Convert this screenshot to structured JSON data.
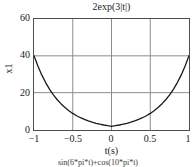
{
  "figure": {
    "title": "2exp(3|t|)",
    "next_figure_caption": "sin(6*pi*t)+cos(10*pi*t)"
  },
  "axes": {
    "y_label": "x1",
    "x_label": "t(s)",
    "y_ticks": [
      "0",
      "20",
      "40",
      "60"
    ],
    "x_ticks": [
      "−1",
      "−0.5",
      "0",
      "0.5",
      "1"
    ]
  },
  "style": {
    "curve_color": "#1a1a1a",
    "grid_color": "#8c8c8c",
    "frame_color": "#4d4d4d",
    "background": "#ffffff"
  },
  "chart_data": {
    "type": "line",
    "title": "2exp(3|t|)",
    "xlabel": "t(s)",
    "ylabel": "x1",
    "xlim": [
      -1,
      1
    ],
    "ylim": [
      0,
      60
    ],
    "xticks": [
      -1,
      -0.5,
      0,
      0.5,
      1
    ],
    "yticks": [
      0,
      20,
      40,
      60
    ],
    "grid": true,
    "legend": null,
    "series": [
      {
        "name": "2exp(3|t|)",
        "formula": "2*exp(3*abs(t))",
        "color": "#1a1a1a",
        "linewidth": 1.2,
        "x": [
          -1,
          -0.95,
          -0.9,
          -0.85,
          -0.8,
          -0.75,
          -0.7,
          -0.65,
          -0.6,
          -0.55,
          -0.5,
          -0.45,
          -0.4,
          -0.35,
          -0.3,
          -0.25,
          -0.2,
          -0.15,
          -0.1,
          -0.05,
          0,
          0.05,
          0.1,
          0.15,
          0.2,
          0.25,
          0.3,
          0.35,
          0.4,
          0.45,
          0.5,
          0.55,
          0.6,
          0.65,
          0.7,
          0.75,
          0.8,
          0.85,
          0.9,
          0.95,
          1
        ],
        "y": [
          40.17,
          34.58,
          29.78,
          25.64,
          22.07,
          19.0,
          16.36,
          14.09,
          12.13,
          10.44,
          8.96,
          7.72,
          6.64,
          5.72,
          4.92,
          4.24,
          3.64,
          3.14,
          2.7,
          2.32,
          2.0,
          2.32,
          2.7,
          3.14,
          3.64,
          4.24,
          4.92,
          5.72,
          6.64,
          7.72,
          8.96,
          10.44,
          12.13,
          14.09,
          16.36,
          19.0,
          22.07,
          25.64,
          29.78,
          34.58,
          40.17
        ]
      }
    ],
    "annotations": {
      "minimum": {
        "t": 0,
        "value": 2.0
      },
      "endpoints": {
        "t_left": -1,
        "t_right": 1,
        "value": 40.17
      }
    }
  }
}
